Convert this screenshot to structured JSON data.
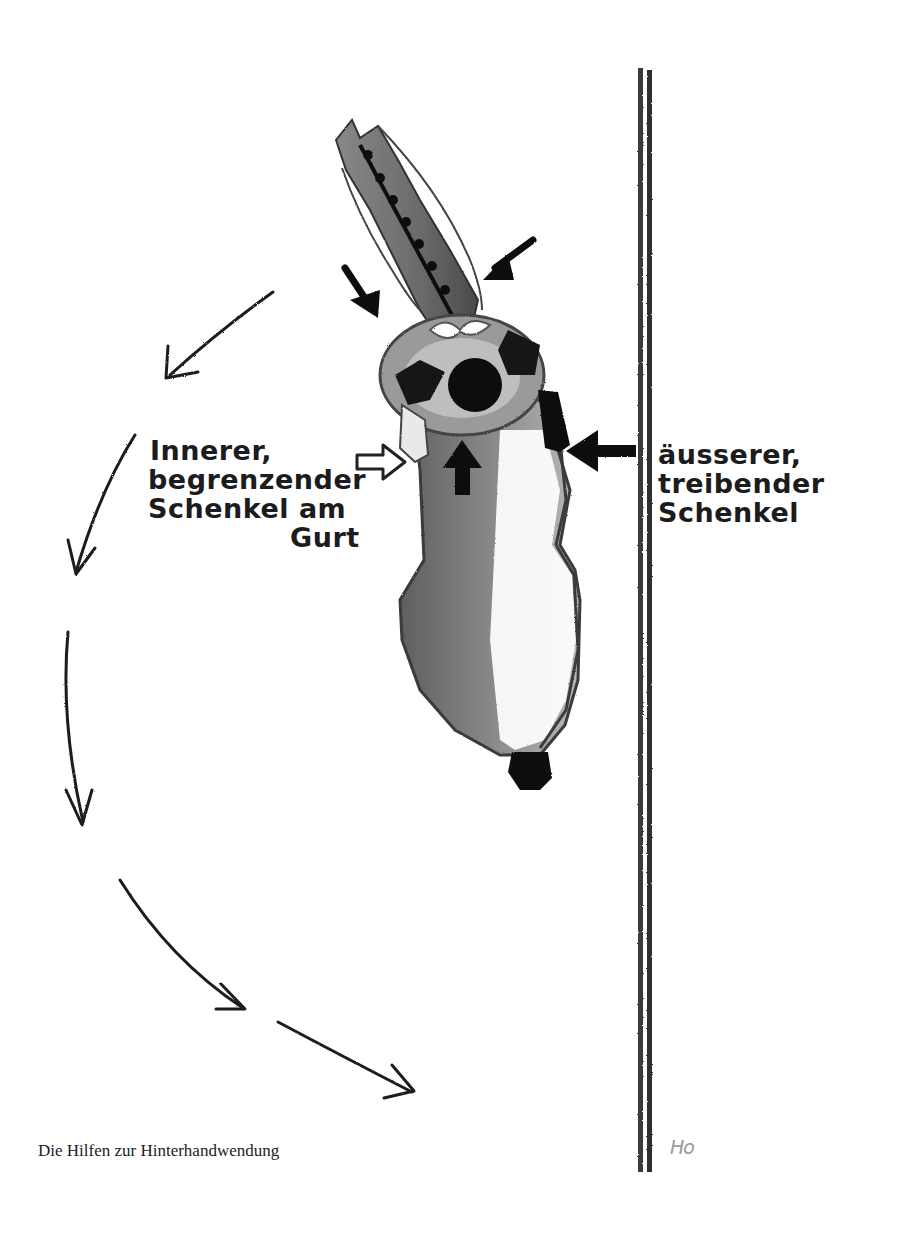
{
  "diagram": {
    "title": "Die Hilfen zur Hinterhandwendung",
    "labels": {
      "inner_leg": {
        "lines": [
          "Innerer,",
          "begrenzender",
          "Schenkel am",
          "Gurt"
        ]
      },
      "outer_leg": {
        "lines": [
          "äusserer,",
          "treibender",
          "Schenkel"
        ]
      }
    },
    "signature": "Ho",
    "elements": {
      "horse": "horse-top-view",
      "wall": "arena-wall-double-line",
      "path_arrows_count": 6
    },
    "colors": {
      "ink": "#1c1c1c",
      "horse_shade": "#7a7a7a",
      "wall": "#3a3a3a",
      "background": "#ffffff"
    }
  }
}
